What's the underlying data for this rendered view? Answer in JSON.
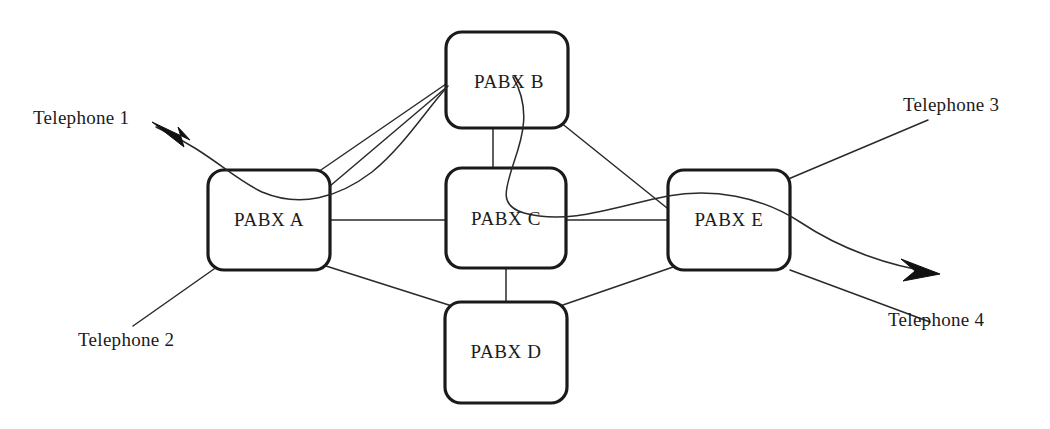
{
  "diagram": {
    "type": "network-topology",
    "background_color": "#ffffff",
    "line_color": "#2a2a2a",
    "node_border_color": "#1a1a1a",
    "text_color": "#1b1b1b"
  },
  "nodes": [
    {
      "id": "a",
      "label": "PABX A",
      "x": 208,
      "y": 170,
      "w": 122,
      "h": 100,
      "r": 16
    },
    {
      "id": "b",
      "label": "PABX B",
      "x": 446,
      "y": 32,
      "w": 122,
      "h": 96,
      "r": 16
    },
    {
      "id": "c",
      "label": "PABX C",
      "x": 446,
      "y": 168,
      "w": 120,
      "h": 100,
      "r": 16
    },
    {
      "id": "d",
      "label": "PABX D",
      "x": 445,
      "y": 302,
      "w": 122,
      "h": 101,
      "r": 16
    },
    {
      "id": "e",
      "label": "PABX E",
      "x": 668,
      "y": 170,
      "w": 122,
      "h": 100,
      "r": 16
    }
  ],
  "endpoints": [
    {
      "id": "t1",
      "label": "Telephone 1",
      "x": 33,
      "y": 108,
      "arrow": true,
      "arrow_direction": "up-left"
    },
    {
      "id": "t2",
      "label": "Telephone 2",
      "x": 78,
      "y": 330,
      "arrow": false,
      "arrow_direction": "none"
    },
    {
      "id": "t3",
      "label": "Telephone 3",
      "x": 903,
      "y": 95,
      "arrow": false,
      "arrow_direction": "none"
    },
    {
      "id": "t4",
      "label": "Telephone 4",
      "x": 888,
      "y": 310,
      "arrow": true,
      "arrow_direction": "right-down"
    }
  ],
  "links": [
    {
      "from": "a",
      "to": "b",
      "style": "straight"
    },
    {
      "from": "a",
      "to": "c",
      "style": "straight"
    },
    {
      "from": "a",
      "to": "d",
      "style": "straight"
    },
    {
      "from": "b",
      "to": "c",
      "style": "straight"
    },
    {
      "from": "b",
      "to": "e",
      "style": "straight"
    },
    {
      "from": "c",
      "to": "d",
      "style": "straight"
    },
    {
      "from": "c",
      "to": "e",
      "style": "straight"
    },
    {
      "from": "d",
      "to": "e",
      "style": "straight"
    },
    {
      "from": "b",
      "to": "e",
      "style": "curved",
      "note": "call path crossing through PABX C"
    },
    {
      "from": "t1",
      "to": "b",
      "style": "curved",
      "note": "call path crossing through PABX A"
    },
    {
      "from": "t2",
      "to": "a",
      "style": "straight"
    },
    {
      "from": "t3",
      "to": "e",
      "style": "straight"
    },
    {
      "from": "t4",
      "to": "e",
      "style": "straight"
    }
  ],
  "paths": {
    "a_b": "M 330 186 L 448 86",
    "a_b_upper": "M 318 172 L 446 84",
    "a_c": "M 330 220 L 446 220",
    "a_d": "M 326 266 L 452 306",
    "b_c": "M 493 128 L 493 168",
    "b_e": "M 560 122 L 672 212",
    "c_d": "M 506 268 L 506 302",
    "c_e": "M 566 220 L 668 220",
    "d_e": "M 560 306 L 676 266",
    "t2_a": "M 133 326 L 214 269",
    "t3_e": "M 928 120 L 786 180",
    "t4_e": "M 790 270 L 930 322",
    "curve_b_to_e": "M 513 77 C 531 108 523 136 514 162 C 504 192 500 206 524 213 C 570 226 620 205 668 196 C 712 188 760 196 800 222 C 842 250 890 266 932 272",
    "curve_t1_to_b": "M 156 127 C 210 152 232 178 262 192 C 300 208 338 198 372 172 C 404 146 426 110 448 86"
  },
  "arrows": {
    "t1_head": {
      "tip_x": 152,
      "tip_y": 122,
      "angle_deg": 210
    },
    "t4_head": {
      "tip_x": 938,
      "tip_y": 274,
      "angle_deg": 22
    }
  }
}
